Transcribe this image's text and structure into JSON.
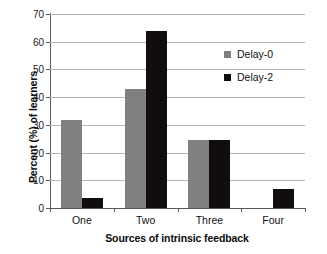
{
  "chart_data": {
    "type": "bar",
    "title": "",
    "xlabel": "Sources of intrinsic feedback",
    "ylabel": "Percent (%) of learners",
    "categories": [
      "One",
      "Two",
      "Three",
      "Four"
    ],
    "series": [
      {
        "name": "Delay-0",
        "color": "#808080",
        "values": [
          31.7,
          42.8,
          24.7,
          0
        ]
      },
      {
        "name": "Delay-2",
        "color": "#100d0c",
        "values": [
          3.7,
          64.0,
          24.7,
          6.8
        ]
      }
    ],
    "ylim": [
      0,
      70
    ],
    "yticks": [
      0,
      10,
      20,
      30,
      40,
      50,
      60,
      70
    ],
    "ytick_labels": [
      "0",
      "10",
      "20",
      "30",
      "40",
      "50",
      "60",
      "70"
    ],
    "grid": "horizontal",
    "legend_position": "upper-right-inside"
  }
}
